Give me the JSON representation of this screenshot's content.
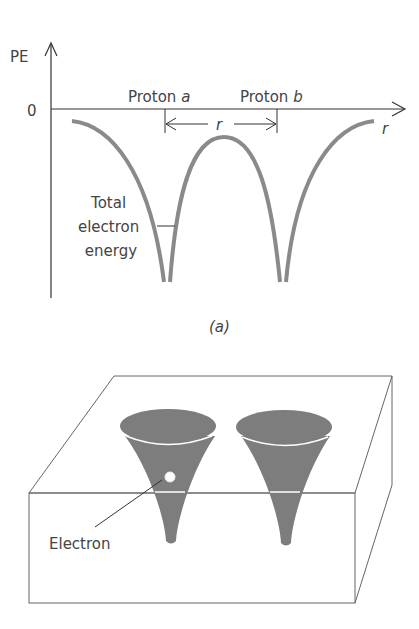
{
  "panel_a": {
    "y_axis_label": "PE",
    "zero_label": "0",
    "x_axis_label": "r",
    "proton_a_text": "Proton ",
    "proton_a_italic": "a",
    "proton_b_text": "Proton ",
    "proton_b_italic": "b",
    "separation_label": "r",
    "curve_label_lines": [
      "Total",
      "electron",
      "energy"
    ],
    "caption": "(a)"
  },
  "panel_b": {
    "electron_label": "Electron"
  },
  "colors": {
    "curve": "#8a8a8a",
    "cone_fill": "#7d7d7d",
    "line": "#555555"
  }
}
